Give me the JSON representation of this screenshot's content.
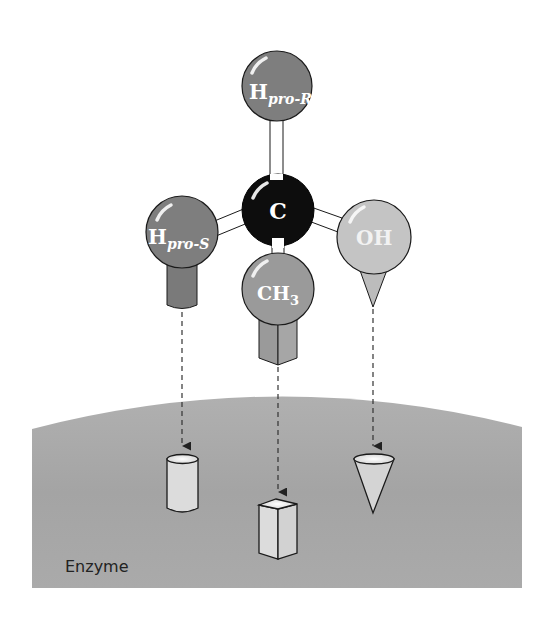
{
  "diagram": {
    "type": "stereochemistry-enzyme-binding",
    "central_atom": {
      "label": "C",
      "color": "#0d0d0d"
    },
    "substituents": [
      {
        "id": "h-pro-r",
        "label_main": "H",
        "label_sub": "pro-R",
        "color": "#7e7e7e",
        "binding_shape": "none"
      },
      {
        "id": "h-pro-s",
        "label_main": "H",
        "label_sub": "pro-S",
        "color": "#7e7e7e",
        "binding_shape": "cylinder"
      },
      {
        "id": "ch3",
        "label_main": "CH",
        "label_sub": "3",
        "color": "#9a9a9a",
        "binding_shape": "box"
      },
      {
        "id": "oh",
        "label_main": "OH",
        "label_sub": "",
        "color": "#c4c4c4",
        "binding_shape": "cone"
      }
    ],
    "enzyme": {
      "label": "Enzyme",
      "color": "#a6a6a6",
      "binding_sites": [
        "cylinder-site",
        "box-site",
        "cone-site"
      ]
    },
    "colors": {
      "stick": "#ffffff",
      "outline": "#1a1a1a",
      "site_fill": "#d9d9d9",
      "arrow": "#333333"
    }
  }
}
